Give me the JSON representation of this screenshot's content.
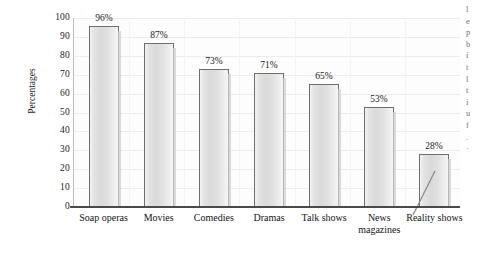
{
  "chart_data": {
    "type": "bar",
    "title": "",
    "xlabel": "",
    "ylabel": "Percentages",
    "categories": [
      "Soap operas",
      "Movies",
      "Comedies",
      "Dramas",
      "Talk shows",
      "News magazines",
      "Reality shows"
    ],
    "category_lines": [
      [
        "Soap operas",
        ""
      ],
      [
        "Movies",
        ""
      ],
      [
        "Comedies",
        ""
      ],
      [
        "Dramas",
        ""
      ],
      [
        "Talk shows",
        ""
      ],
      [
        "News",
        "magazines"
      ],
      [
        "Reality shows",
        ""
      ]
    ],
    "values": [
      96,
      87,
      73,
      71,
      65,
      53,
      28
    ],
    "value_labels": [
      "96%",
      "87%",
      "73%",
      "71%",
      "65%",
      "53%",
      "28%"
    ],
    "ylim": [
      0,
      100
    ],
    "ytick_labels": [
      "100",
      "90",
      "80",
      "70",
      "60",
      "50",
      "40",
      "30",
      "20",
      "10",
      "0"
    ],
    "ytick_values": [
      100,
      90,
      80,
      70,
      60,
      50,
      40,
      30,
      20,
      10,
      0
    ],
    "grid": true,
    "legend": null,
    "annotations": [
      {
        "name": "leader-line-news-magazines",
        "kind": "line",
        "note": "diagonal pointer line left of the News magazines bar"
      }
    ],
    "colors": {
      "bar_fill": "#e0e0e0",
      "bar_border": "#6d6d6d",
      "axis": "#4a4a4a",
      "grid": "#ececec",
      "text": "#1a1a1a",
      "background": "#ffffff"
    }
  },
  "side_text_fragments": [
    "l",
    "e",
    "p",
    "b",
    "i",
    "t",
    "l",
    "t",
    "i",
    "u",
    "f",
    ".",
    "·"
  ]
}
